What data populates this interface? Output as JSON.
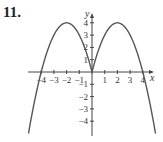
{
  "problem_number": "11.",
  "chart_data": {
    "type": "line",
    "title": "",
    "xlabel": "x",
    "ylabel": "y",
    "function": "y = -x^2 + 4|x|",
    "x_ticks": [
      -4,
      -3,
      -2,
      -1,
      1,
      2,
      3,
      4
    ],
    "y_ticks": [
      -4,
      -3,
      -2,
      -1,
      1,
      2,
      3,
      4
    ],
    "x_tick_labels": [
      "-4",
      "-3",
      "-2",
      "-1",
      "1",
      "2",
      "3",
      "4"
    ],
    "y_tick_labels": [
      "-4",
      "-3",
      "-2",
      "-1",
      "1",
      "2",
      "3",
      "4"
    ],
    "xlim": [
      -5,
      5
    ],
    "ylim": [
      -5,
      4.5
    ],
    "grid": false,
    "series": [
      {
        "name": "curve",
        "x": [
          -5,
          -4,
          -3,
          -2,
          -1,
          0,
          1,
          2,
          3,
          4,
          5
        ],
        "y": [
          -5,
          0,
          3,
          4,
          3,
          0,
          3,
          4,
          3,
          0,
          -5
        ]
      }
    ],
    "color": "#555555"
  }
}
